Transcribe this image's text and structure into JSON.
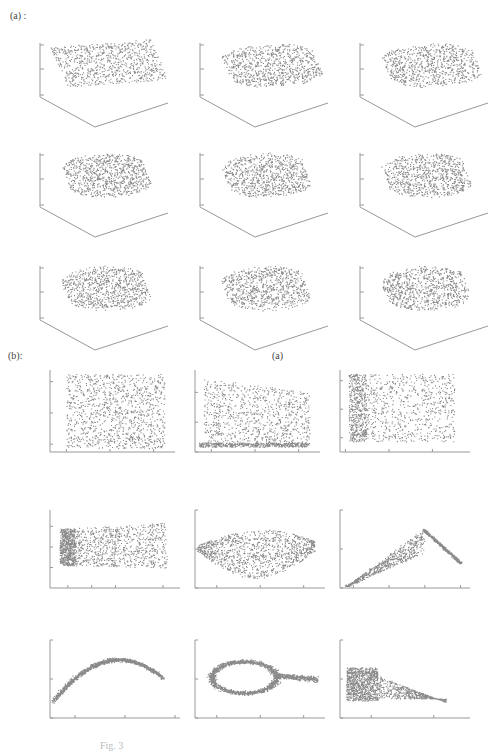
{
  "figure": {
    "section_a_label": "(a)   :",
    "section_b_label": "(b):",
    "stray_label": "(a)",
    "caption": "Fig. 3"
  },
  "chart_data": [
    {
      "type": "scatter",
      "panel": "a",
      "projection": "3d",
      "title_prefix": "noise = ",
      "subplots": [
        {
          "title": "noise = 0",
          "noise": 0,
          "zticks": [
            "20",
            "0",
            "−20"
          ],
          "yticks": [
            "20",
            "0"
          ],
          "xticks": [
            "0",
            "10"
          ]
        },
        {
          "title": "noise = 0.1",
          "noise": 0.1,
          "zticks": [
            "20",
            "0",
            "−20"
          ],
          "yticks": [
            "20",
            "0"
          ],
          "xticks": [
            "0",
            "10"
          ]
        },
        {
          "title": "noise = 0.2",
          "noise": 0.2,
          "zticks": [
            "20",
            "0",
            "−20"
          ],
          "yticks": [
            "20",
            "0"
          ],
          "xticks": [
            "0",
            "10"
          ]
        },
        {
          "title": "noise = 0.3",
          "noise": 0.3,
          "zticks": [
            "20",
            "0",
            "−20"
          ],
          "yticks": [
            "20",
            "0"
          ],
          "xticks": [
            "-10",
            "0",
            "10"
          ]
        },
        {
          "title": "noise = 0.4",
          "noise": 0.4,
          "zticks": [
            "20",
            "0",
            "−20"
          ],
          "yticks": [
            "20",
            "0"
          ],
          "xticks": [
            "−10",
            "0",
            "10"
          ]
        },
        {
          "title": "noise = 0.5",
          "noise": 0.5,
          "zticks": [
            "20",
            "0",
            "−20"
          ],
          "yticks": [
            "20",
            "0"
          ],
          "xticks": [
            "−10",
            "0",
            "10"
          ]
        },
        {
          "title": "noise = 0.6",
          "noise": 0.6,
          "zticks": [
            "20",
            "0",
            "−20"
          ],
          "yticks": [
            "20",
            "0"
          ],
          "xticks": [
            "−10",
            "0",
            "10"
          ]
        },
        {
          "title": "noise = 0.7",
          "noise": 0.7,
          "zticks": [
            "20",
            "0",
            "−20"
          ],
          "yticks": [
            "20",
            "0"
          ],
          "xticks": [
            "−10",
            "0",
            "10"
          ]
        },
        {
          "title": "noise = 0.8",
          "noise": 0.8,
          "zticks": [
            "20",
            "0",
            "−20"
          ],
          "yticks": [
            "20",
            "0"
          ],
          "xticks": [
            "−10",
            "0",
            "10"
          ]
        }
      ],
      "description": "Swiss-roll-like 3D point clouds with increasing noise"
    },
    {
      "type": "scatter",
      "panel": "b",
      "projection": "2d",
      "subplots": [
        {
          "title": "noise = 0",
          "noise": 0,
          "xticks": [
            "−0.04",
            "0",
            "0.04"
          ],
          "yticks": [
            "0.04",
            "0",
            "−0.04"
          ],
          "xlim": [
            -0.055,
            0.055
          ],
          "ylim": [
            -0.05,
            0.055
          ],
          "shape": "uniform-rectangle"
        },
        {
          "title": "noise = 0.1",
          "noise": 0.1,
          "xticks": [
            "−0.04",
            "0",
            "0.04"
          ],
          "yticks": [
            "0.04",
            "0",
            "−0.04"
          ],
          "xlim": [
            -0.055,
            0.055
          ],
          "ylim": [
            -0.04,
            0.07
          ],
          "shape": "rectangle-dense-bottom-edge"
        },
        {
          "title": "noise = 0.2",
          "noise": 0.2,
          "xticks": [
            "−0.04",
            "0",
            "0.04"
          ],
          "yticks": [
            "0.04",
            "0",
            "−0.04"
          ],
          "xlim": [
            -0.045,
            0.07
          ],
          "ylim": [
            -0.06,
            0.055
          ],
          "shape": "rectangle-dense-left-edge"
        },
        {
          "title": "noise = 0.3",
          "noise": 0.3,
          "xticks": [
            "−0.02",
            "0",
            "0.02",
            "0.06"
          ],
          "yticks": [
            "0.05",
            "0",
            "−0.05"
          ],
          "xlim": [
            -0.035,
            0.07
          ],
          "ylim": [
            -0.1,
            0.09
          ],
          "shape": "trapezoid-dense-left-edge"
        },
        {
          "title": "noise = 0.4",
          "noise": 0.4,
          "xticks": [
            "−0.04",
            "0",
            "0.04"
          ],
          "yticks": [
            "0.1",
            "0",
            "−0.1"
          ],
          "xlim": [
            -0.06,
            0.055
          ],
          "ylim": [
            -0.1,
            0.1
          ],
          "shape": "lens"
        },
        {
          "title": "noise = 0.5",
          "noise": 0.5,
          "xticks": [
            "−0.08",
            "−0.04",
            "0",
            "0.04"
          ],
          "yticks": [
            "0.1",
            "0",
            "−0.1"
          ],
          "xlim": [
            -0.095,
            0.045
          ],
          "ylim": [
            -0.1,
            0.1
          ],
          "shape": "chevron"
        },
        {
          "title": "noise = 0.6",
          "noise": 0.6,
          "xticks": [
            "−0.04",
            "0",
            "0.04"
          ],
          "yticks": [
            "0.1",
            "0",
            "−0.1"
          ],
          "xlim": [
            -0.06,
            0.04
          ],
          "ylim": [
            -0.1,
            0.1
          ],
          "shape": "arc"
        },
        {
          "title": "noise = 0.7",
          "noise": 0.7,
          "xticks": [
            "−0.04",
            "0",
            "0.04"
          ],
          "yticks": [
            "0.1",
            "0",
            "−0.1"
          ],
          "xlim": [
            -0.06,
            0.055
          ],
          "ylim": [
            -0.1,
            0.1
          ],
          "shape": "loop"
        },
        {
          "title": "noise = 0.8",
          "noise": 0.8,
          "xticks": [
            "0",
            "0.1"
          ],
          "yticks": [
            "0.1",
            "0",
            "−0.1"
          ],
          "xlim": [
            -0.05,
            0.15
          ],
          "ylim": [
            -0.1,
            0.1
          ],
          "shape": "dense-square-plus-fan"
        }
      ],
      "description": "2D embeddings of the 3D data for each noise level"
    }
  ],
  "style": {
    "point_color": "#8a8a8a",
    "axis_color": "#999999",
    "text_color": "#111111"
  }
}
